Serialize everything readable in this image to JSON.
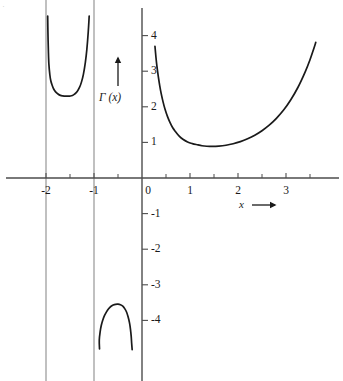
{
  "chart_data": {
    "type": "line",
    "title": "",
    "subtitle": "",
    "xlabel": "x",
    "ylabel": "Γ (x)",
    "xlabel_suffix": "→",
    "xlim": [
      -2.12,
      4.19
    ],
    "ylim": [
      -4.72,
      4.53
    ],
    "grid": false,
    "legend": null,
    "x_ticks": [
      -2,
      -1,
      0,
      1,
      2,
      3
    ],
    "x_tick_labels": [
      "-2",
      "-1",
      "0",
      "1",
      "2",
      "3"
    ],
    "x_minor_ticks": [
      -1.5,
      -0.5,
      0.5,
      1.5,
      2.5,
      3.5
    ],
    "y_ticks": [
      4,
      3,
      2,
      1,
      -1,
      -2,
      -3,
      -4
    ],
    "y_tick_labels": [
      "4",
      "3",
      "2",
      "1",
      "-1",
      "-2",
      "-3",
      "-4"
    ],
    "asymptotes": [
      -2,
      -1,
      0
    ],
    "asymptotes_drawn": [
      -2,
      -1
    ],
    "series": [
      {
        "name": "Γ (x) branch on (-2, -1)",
        "comment": "U-shaped branch, minimum Γ(-1.5034) ≈ 2.30",
        "points": [
          [
            -1.965,
            4.55
          ],
          [
            -1.96,
            4.1
          ],
          [
            -1.95,
            3.55
          ],
          [
            -1.94,
            3.2
          ],
          [
            -1.92,
            2.9
          ],
          [
            -1.9,
            2.73
          ],
          [
            -1.87,
            2.6
          ],
          [
            -1.84,
            2.5
          ],
          [
            -1.8,
            2.42
          ],
          [
            -1.75,
            2.36
          ],
          [
            -1.7,
            2.32
          ],
          [
            -1.65,
            2.305
          ],
          [
            -1.6,
            2.298
          ],
          [
            -1.55,
            2.301
          ],
          [
            -1.5,
            2.302
          ],
          [
            -1.45,
            2.315
          ],
          [
            -1.4,
            2.36
          ],
          [
            -1.35,
            2.43
          ],
          [
            -1.3,
            2.55
          ],
          [
            -1.26,
            2.7
          ],
          [
            -1.22,
            2.92
          ],
          [
            -1.18,
            3.25
          ],
          [
            -1.15,
            3.6
          ],
          [
            -1.12,
            4.1
          ],
          [
            -1.1,
            4.55
          ]
        ]
      },
      {
        "name": "Γ (x) branch on (-1, 0)",
        "comment": "Inverted-U branch, maximum Γ(-0.5041) ≈ -3.545",
        "points": [
          [
            -0.885,
            -4.8
          ],
          [
            -0.89,
            -4.55
          ],
          [
            -0.87,
            -4.3
          ],
          [
            -0.85,
            -4.15
          ],
          [
            -0.82,
            -4.0
          ],
          [
            -0.78,
            -3.86
          ],
          [
            -0.74,
            -3.76
          ],
          [
            -0.7,
            -3.68
          ],
          [
            -0.65,
            -3.61
          ],
          [
            -0.6,
            -3.57
          ],
          [
            -0.55,
            -3.548
          ],
          [
            -0.5,
            -3.545
          ],
          [
            -0.45,
            -3.56
          ],
          [
            -0.4,
            -3.6
          ],
          [
            -0.36,
            -3.67
          ],
          [
            -0.32,
            -3.77
          ],
          [
            -0.29,
            -3.9
          ],
          [
            -0.26,
            -4.07
          ],
          [
            -0.24,
            -4.25
          ],
          [
            -0.225,
            -4.45
          ],
          [
            -0.215,
            -4.65
          ],
          [
            -0.205,
            -4.82
          ]
        ]
      },
      {
        "name": "Γ (x) branch on (0, ∞)",
        "comment": "Main branch, minimum Γ(1.4616) ≈ 0.8856",
        "points": [
          [
            0.27,
            3.7
          ],
          [
            0.29,
            3.4
          ],
          [
            0.31,
            3.15
          ],
          [
            0.34,
            2.85
          ],
          [
            0.37,
            2.59
          ],
          [
            0.4,
            2.37
          ],
          [
            0.44,
            2.13
          ],
          [
            0.48,
            1.93
          ],
          [
            0.53,
            1.73
          ],
          [
            0.58,
            1.57
          ],
          [
            0.64,
            1.41
          ],
          [
            0.7,
            1.3
          ],
          [
            0.78,
            1.17
          ],
          [
            0.86,
            1.08
          ],
          [
            0.95,
            1.01
          ],
          [
            1.05,
            0.966
          ],
          [
            1.15,
            0.934
          ],
          [
            1.25,
            0.906
          ],
          [
            1.35,
            0.892
          ],
          [
            1.46,
            0.886
          ],
          [
            1.6,
            0.894
          ],
          [
            1.75,
            0.919
          ],
          [
            1.9,
            0.962
          ],
          [
            2.05,
            1.022
          ],
          [
            2.2,
            1.102
          ],
          [
            2.35,
            1.203
          ],
          [
            2.5,
            1.329
          ],
          [
            2.65,
            1.484
          ],
          [
            2.8,
            1.676
          ],
          [
            2.95,
            1.908
          ],
          [
            3.1,
            2.198
          ],
          [
            3.25,
            2.549
          ],
          [
            3.4,
            2.982
          ],
          [
            3.5,
            3.323
          ],
          [
            3.58,
            3.64
          ],
          [
            3.62,
            3.81
          ]
        ]
      }
    ],
    "annotations": [
      {
        "name": "y-axis-arrow",
        "text": "",
        "glyph": "↑"
      },
      {
        "name": "x-axis-arrow",
        "text": "",
        "glyph": "→"
      }
    ],
    "colors": {
      "curve": "#1a1a1a",
      "axis": "#4d4d4d",
      "asymptote": "#8c8c8c",
      "background": "#ffffff",
      "text": "#1a1a1a"
    }
  },
  "figure": {
    "corner_mark": "·"
  }
}
